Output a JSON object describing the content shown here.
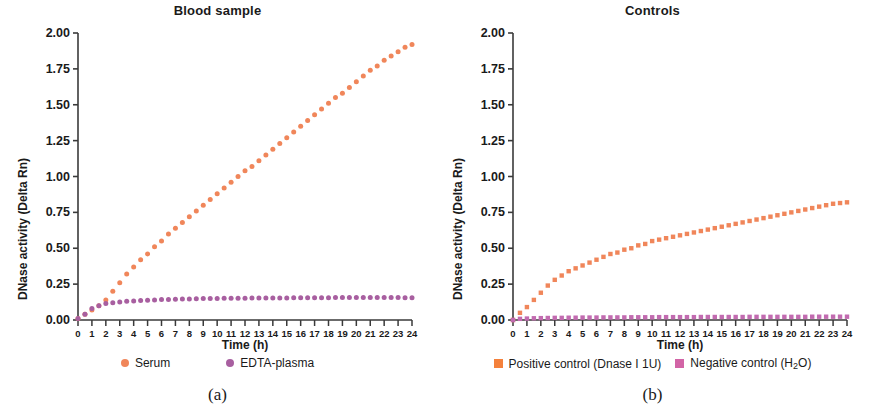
{
  "figure": {
    "width": 870,
    "height": 407
  },
  "panels": [
    {
      "id": "blood-sample",
      "title": "Blood sample",
      "caption": "(a)",
      "xlabel": "Time (h)",
      "ylabel": "DNase activity (Delta Rn)",
      "marker_shape": "circle",
      "legend": [
        {
          "label": "Serum",
          "color": "#F0865A"
        },
        {
          "label": "EDTA-plasma",
          "color": "#A85FA0"
        }
      ]
    },
    {
      "id": "controls",
      "title": "Controls",
      "caption": "(b)",
      "xlabel": "Time (h)",
      "ylabel": "DNase activity (Delta Rn)",
      "marker_shape": "square",
      "legend": [
        {
          "label": "Positive control (Dnase I 1U)",
          "color": "#F4813C",
          "html": "Positive control (Dnase I 1U)"
        },
        {
          "label": "Negative control (H2O)",
          "color": "#D264A6",
          "html": "Negative control (H<sub>2</sub>O)"
        }
      ]
    }
  ],
  "chart_data": [
    {
      "type": "scatter",
      "title": "Blood sample",
      "caption": "(a)",
      "xlabel": "Time (h)",
      "ylabel": "DNase activity (Delta Rn)",
      "xlim": [
        0,
        24
      ],
      "ylim": [
        0,
        2.0
      ],
      "yticks": [
        0.0,
        0.25,
        0.5,
        0.75,
        1.0,
        1.25,
        1.5,
        1.75,
        2.0
      ],
      "ytick_labels": [
        "0.00",
        "0.25",
        "0.50",
        "0.75",
        "1.00",
        "1.25",
        "1.50",
        "1.75",
        "2.00"
      ],
      "xticks": [
        0,
        1,
        2,
        3,
        4,
        5,
        6,
        7,
        8,
        9,
        10,
        11,
        12,
        13,
        14,
        15,
        16,
        17,
        18,
        19,
        20,
        21,
        22,
        23,
        24
      ],
      "xtick_labels": [
        "0",
        "1",
        "2",
        "3",
        "4",
        "5",
        "6",
        "7",
        "8",
        "9",
        "10",
        "11",
        "12",
        "13",
        "14",
        "15",
        "16",
        "17",
        "18",
        "19",
        "20",
        "21",
        "22",
        "23",
        "24"
      ],
      "grid": false,
      "legend_position": "below",
      "marker": "circle",
      "x": [
        0,
        0.5,
        1,
        1.5,
        2,
        2.5,
        3,
        3.5,
        4,
        4.5,
        5,
        5.5,
        6,
        6.5,
        7,
        7.5,
        8,
        8.5,
        9,
        9.5,
        10,
        10.5,
        11,
        11.5,
        12,
        12.5,
        13,
        13.5,
        14,
        14.5,
        15,
        15.5,
        16,
        16.5,
        17,
        17.5,
        18,
        18.5,
        19,
        19.5,
        20,
        20.5,
        21,
        21.5,
        22,
        22.5,
        23,
        23.5,
        24
      ],
      "series": [
        {
          "name": "Serum",
          "color": "#F0865A",
          "values": [
            0.01,
            0.04,
            0.07,
            0.1,
            0.14,
            0.2,
            0.26,
            0.32,
            0.37,
            0.42,
            0.46,
            0.51,
            0.55,
            0.6,
            0.64,
            0.68,
            0.72,
            0.76,
            0.8,
            0.84,
            0.88,
            0.92,
            0.96,
            1.0,
            1.04,
            1.07,
            1.11,
            1.15,
            1.19,
            1.23,
            1.27,
            1.31,
            1.35,
            1.39,
            1.43,
            1.47,
            1.51,
            1.55,
            1.58,
            1.62,
            1.66,
            1.7,
            1.74,
            1.77,
            1.81,
            1.84,
            1.87,
            1.9,
            1.92
          ]
        },
        {
          "name": "EDTA-plasma",
          "color": "#A85FA0",
          "values": [
            0.01,
            0.04,
            0.08,
            0.1,
            0.115,
            0.12,
            0.125,
            0.13,
            0.133,
            0.136,
            0.138,
            0.14,
            0.142,
            0.143,
            0.145,
            0.146,
            0.147,
            0.148,
            0.149,
            0.15,
            0.15,
            0.151,
            0.151,
            0.152,
            0.152,
            0.153,
            0.153,
            0.153,
            0.154,
            0.154,
            0.154,
            0.155,
            0.155,
            0.155,
            0.155,
            0.155,
            0.155,
            0.156,
            0.156,
            0.156,
            0.156,
            0.156,
            0.156,
            0.156,
            0.156,
            0.156,
            0.156,
            0.155,
            0.155
          ]
        }
      ]
    },
    {
      "type": "scatter",
      "title": "Controls",
      "caption": "(b)",
      "xlabel": "Time (h)",
      "ylabel": "DNase activity (Delta Rn)",
      "xlim": [
        0,
        24
      ],
      "ylim": [
        0,
        2.0
      ],
      "yticks": [
        0.0,
        0.25,
        0.5,
        0.75,
        1.0,
        1.25,
        1.5,
        1.75,
        2.0
      ],
      "ytick_labels": [
        "0.00",
        "0.25",
        "0.50",
        "0.75",
        "1.00",
        "1.25",
        "1.50",
        "1.75",
        "2.00"
      ],
      "xticks": [
        0,
        1,
        2,
        3,
        4,
        5,
        6,
        7,
        8,
        9,
        10,
        11,
        12,
        13,
        14,
        15,
        16,
        17,
        18,
        19,
        20,
        21,
        22,
        23,
        24
      ],
      "xtick_labels": [
        "0",
        "1",
        "2",
        "3",
        "4",
        "5",
        "6",
        "7",
        "8",
        "9",
        "10",
        "11",
        "12",
        "13",
        "14",
        "15",
        "16",
        "17",
        "18",
        "19",
        "20",
        "21",
        "22",
        "23",
        "24"
      ],
      "grid": false,
      "legend_position": "below",
      "marker": "square",
      "x": [
        0,
        0.5,
        1,
        1.5,
        2,
        2.5,
        3,
        3.5,
        4,
        4.5,
        5,
        5.5,
        6,
        6.5,
        7,
        7.5,
        8,
        8.5,
        9,
        9.5,
        10,
        10.5,
        11,
        11.5,
        12,
        12.5,
        13,
        13.5,
        14,
        14.5,
        15,
        15.5,
        16,
        16.5,
        17,
        17.5,
        18,
        18.5,
        19,
        19.5,
        20,
        20.5,
        21,
        21.5,
        22,
        22.5,
        23,
        23.5,
        24
      ],
      "series": [
        {
          "name": "Positive control (Dnase I 1U)",
          "color": "#F0865A",
          "values": [
            0.0,
            0.05,
            0.09,
            0.14,
            0.19,
            0.24,
            0.28,
            0.31,
            0.34,
            0.36,
            0.38,
            0.4,
            0.42,
            0.44,
            0.46,
            0.47,
            0.49,
            0.5,
            0.52,
            0.53,
            0.55,
            0.56,
            0.57,
            0.58,
            0.59,
            0.6,
            0.61,
            0.62,
            0.63,
            0.64,
            0.65,
            0.66,
            0.67,
            0.68,
            0.69,
            0.7,
            0.71,
            0.72,
            0.73,
            0.74,
            0.75,
            0.76,
            0.77,
            0.78,
            0.79,
            0.8,
            0.81,
            0.815,
            0.82
          ]
        },
        {
          "name": "Negative control (H2O)",
          "color": "#C26BB0",
          "values": [
            0.0,
            0.008,
            0.01,
            0.012,
            0.013,
            0.014,
            0.015,
            0.015,
            0.016,
            0.016,
            0.017,
            0.017,
            0.017,
            0.018,
            0.018,
            0.018,
            0.018,
            0.019,
            0.019,
            0.019,
            0.019,
            0.02,
            0.02,
            0.02,
            0.02,
            0.02,
            0.02,
            0.021,
            0.021,
            0.021,
            0.021,
            0.021,
            0.021,
            0.021,
            0.022,
            0.022,
            0.022,
            0.022,
            0.022,
            0.022,
            0.022,
            0.022,
            0.022,
            0.023,
            0.023,
            0.023,
            0.023,
            0.023,
            0.023
          ]
        }
      ]
    }
  ]
}
